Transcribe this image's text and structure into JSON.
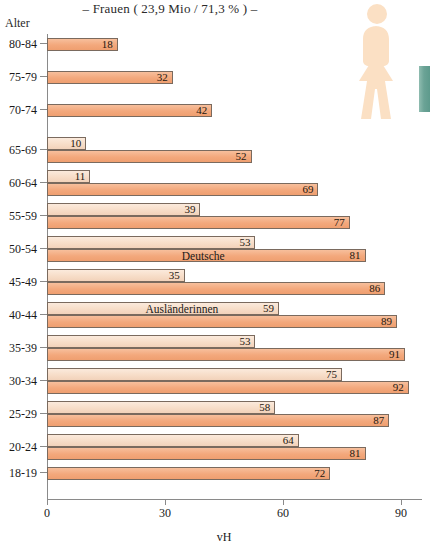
{
  "chart_data": {
    "type": "bar",
    "orientation": "horizontal",
    "title": "–  Frauen ( 23,9 Mio / 71,3 % )  –",
    "xlabel": "vH",
    "ylabel": "Alter",
    "xlim": [
      0,
      90
    ],
    "xticks": [
      0,
      30,
      60,
      90
    ],
    "xtick_labels": [
      "0",
      "30",
      "60",
      "90"
    ],
    "grid": false,
    "legend_position": "inline-annotation",
    "categories": [
      "80-84",
      "75-79",
      "70-74",
      "65-69",
      "60-64",
      "55-59",
      "50-54",
      "45-49",
      "40-44",
      "35-39",
      "30-34",
      "25-29",
      "20-24",
      "18-19"
    ],
    "series": [
      {
        "name": "Ausländerinnen",
        "color": "#f7ddc8",
        "values": [
          null,
          null,
          null,
          10,
          11,
          39,
          53,
          35,
          59,
          53,
          75,
          58,
          64,
          null
        ]
      },
      {
        "name": "Deutsche",
        "color": "#f3a87c",
        "values": [
          18,
          32,
          42,
          52,
          69,
          77,
          81,
          86,
          89,
          91,
          92,
          87,
          81,
          72
        ]
      }
    ],
    "annotations": [
      {
        "text": "Deutsche",
        "category": "50-54",
        "series": "Deutsche"
      },
      {
        "text": "Ausländerinnen",
        "category": "40-44",
        "series": "Ausländerinnen"
      }
    ]
  },
  "decoration": {
    "pictogram": "female-figure-icon",
    "pictogram_color": "#fbe0c4",
    "accent_chip_color": "#6ba396"
  }
}
